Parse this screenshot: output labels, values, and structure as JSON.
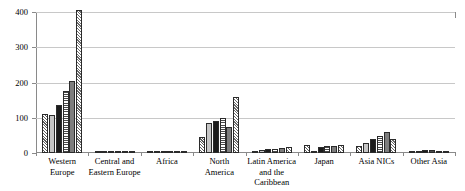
{
  "chart_data": {
    "type": "bar",
    "title": "",
    "subtitle": "",
    "xlabel": "",
    "ylabel": "",
    "ylim": [
      0,
      400
    ],
    "yticks": [
      0,
      100,
      200,
      300,
      400
    ],
    "grid": true,
    "legend_position": "none",
    "grouped": true,
    "categories": [
      "Western Europe",
      "Central and Eastern Europe",
      "Africa",
      "North America",
      "Latin America and the Caribbean",
      "Japan",
      "Asia NICs",
      "Other Asia"
    ],
    "category_lines": [
      [
        "Western",
        "Europe"
      ],
      [
        "Central and",
        "Eastern Europe"
      ],
      [
        "Africa"
      ],
      [
        "North",
        "America"
      ],
      [
        "Latin America",
        "and the",
        "Caribbean"
      ],
      [
        "Japan"
      ],
      [
        "Asia NICs"
      ],
      [
        "Other Asia"
      ]
    ],
    "series": [
      {
        "name": "Series 1",
        "pattern": "diagonal-hatch",
        "values": [
          110,
          1,
          1,
          45,
          4,
          22,
          20,
          4
        ]
      },
      {
        "name": "Series 2",
        "pattern": "light-gray-solid",
        "values": [
          108,
          2,
          1,
          85,
          9,
          6,
          28,
          4
        ]
      },
      {
        "name": "Series 3",
        "pattern": "black-solid",
        "values": [
          135,
          3,
          1,
          90,
          10,
          18,
          40,
          8
        ]
      },
      {
        "name": "Series 4",
        "pattern": "horizontal-stripes",
        "values": [
          175,
          3,
          1,
          100,
          11,
          20,
          48,
          8
        ]
      },
      {
        "name": "Series 5",
        "pattern": "dark-gray-solid",
        "values": [
          205,
          3,
          1,
          75,
          13,
          20,
          60,
          6
        ]
      },
      {
        "name": "Series 6",
        "pattern": "diagonal-hatch",
        "values": [
          405,
          4,
          1,
          160,
          16,
          22,
          40,
          7
        ]
      }
    ]
  },
  "axis": {
    "y_tick_labels": [
      "400",
      "300",
      "200",
      "100",
      "0"
    ]
  }
}
